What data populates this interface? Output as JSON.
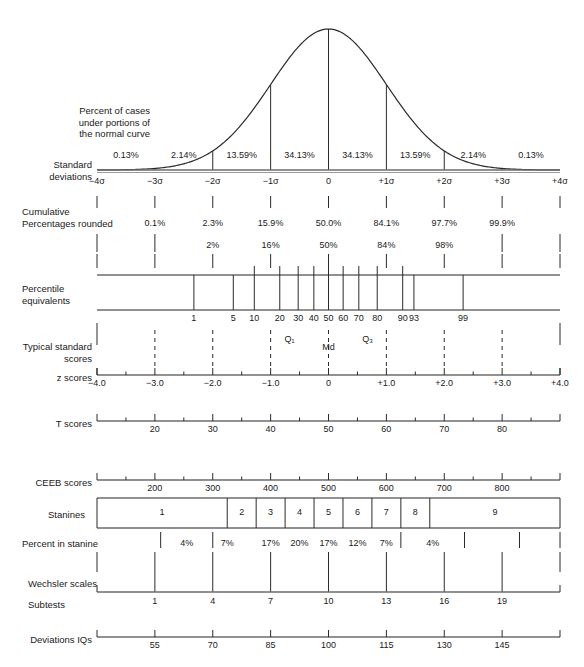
{
  "figure": {
    "faint_header": "",
    "axis": {
      "z_min": -4,
      "z_max": 4,
      "x_at_zmin": 97,
      "x_at_zmax": 560
    }
  },
  "rows": {
    "percent_cases": {
      "label_lines": [
        "Percent of cases",
        "under portions of",
        "the normal curve"
      ],
      "values": [
        "0.13%",
        "2.14%",
        "13.59%",
        "34.13%",
        "34.13%",
        "13.59%",
        "2.14%",
        "0.13%"
      ],
      "value_z_centers": [
        -3.5,
        -2.5,
        -1.5,
        -0.5,
        0.5,
        1.5,
        2.5,
        3.5
      ]
    },
    "standard_deviations": {
      "label_lines": [
        "Standard",
        "deviations"
      ],
      "tick_labels": [
        "−4σ",
        "−3σ",
        "−2σ",
        "−1σ",
        "0",
        "+1σ",
        "+2σ",
        "+3σ",
        "+4σ"
      ],
      "tick_z": [
        -4,
        -3,
        -2,
        -1,
        0,
        1,
        2,
        3,
        4
      ]
    },
    "cumulative_percentages": {
      "label_lines": [
        "Cumulative",
        "Percentages rounded"
      ],
      "values": [
        "0.1%",
        "2.3%",
        "15.9%",
        "50.0%",
        "84.1%",
        "97.7%",
        "99.9%"
      ],
      "value_z": [
        -3,
        -2,
        -1,
        0,
        1,
        2,
        3
      ],
      "rounded_values": [
        "2%",
        "16%",
        "50%",
        "84%",
        "98%"
      ],
      "rounded_z": [
        -2,
        -1,
        0,
        1,
        2
      ]
    },
    "percentile_equivalents": {
      "label_lines": [
        "Percentile",
        "equivalents"
      ],
      "values": [
        "1",
        "5",
        "10",
        "20",
        "30",
        "40",
        "50",
        "60",
        "70",
        "80",
        "90",
        "93",
        "99"
      ],
      "value_percentiles": [
        1,
        5,
        10,
        20,
        30,
        40,
        50,
        60,
        70,
        80,
        90,
        93,
        99
      ],
      "value_z": [
        -2.326,
        -1.645,
        -1.282,
        -0.842,
        -0.524,
        -0.253,
        0,
        0.253,
        0.524,
        0.842,
        1.282,
        1.476,
        2.326
      ]
    },
    "typical_standard_scores": {
      "label_lines": [
        "Typical standard",
        "scores"
      ],
      "quartile_labels": [
        "Q₁",
        "Md",
        "Q₃"
      ],
      "quartile_z": [
        -0.675,
        0,
        0.675
      ]
    },
    "z_scores": {
      "label": "z scores",
      "tick_labels": [
        "−4.0",
        "−3.0",
        "−2.0",
        "−1.0",
        "0",
        "+1.0",
        "+2.0",
        "+3.0",
        "+4.0"
      ],
      "tick_z": [
        -4,
        -3,
        -2,
        -1,
        0,
        1,
        2,
        3,
        4
      ]
    },
    "t_scores": {
      "label": "T scores",
      "tick_labels": [
        "20",
        "30",
        "40",
        "50",
        "60",
        "70",
        "80"
      ],
      "tick_z": [
        -3,
        -2,
        -1,
        0,
        1,
        2,
        3
      ]
    },
    "ceeb_scores": {
      "label": "CEEB scores",
      "tick_labels": [
        "200",
        "300",
        "400",
        "500",
        "600",
        "700",
        "800"
      ],
      "tick_z": [
        -3,
        -2,
        -1,
        0,
        1,
        2,
        3
      ]
    },
    "stanines": {
      "label": "Stanines",
      "values": [
        "1",
        "2",
        "3",
        "4",
        "5",
        "6",
        "7",
        "8",
        "9"
      ],
      "band_centers_z": [
        -2.5,
        -1.75,
        -1.25,
        -0.75,
        -0.25,
        0.25,
        0.75,
        1.25,
        1.75,
        2.5
      ],
      "band_edges_z": [
        -4,
        -1.75,
        -1.25,
        -0.75,
        -0.25,
        0.25,
        0.75,
        1.25,
        1.75,
        4
      ]
    },
    "percent_in_stanine": {
      "label": "Percent in stanine",
      "values": [
        "4%",
        "7%",
        "17%",
        "20%",
        "17%",
        "12%",
        "7%",
        "4%"
      ],
      "value_z": [
        -2.45,
        -1.75,
        -1.0,
        -0.5,
        0.0,
        0.5,
        1.0,
        1.8
      ]
    },
    "wechsler_scales": {
      "label": "Wechsler scales",
      "subtests_label": "Subtests",
      "tick_labels": [
        "1",
        "4",
        "7",
        "10",
        "13",
        "16",
        "19"
      ],
      "tick_z": [
        -3,
        -2,
        -1,
        0,
        1,
        2,
        3
      ]
    },
    "deviation_iqs": {
      "label": "Deviations IQs",
      "tick_labels": [
        "55",
        "70",
        "85",
        "100",
        "115",
        "130",
        "145"
      ],
      "tick_z": [
        -3,
        -2,
        -1,
        0,
        1,
        2,
        3
      ]
    }
  },
  "chart_data": {
    "type": "line",
    "xlabel": "Standard deviations (z)",
    "ylabel": "Relative frequency",
    "xlim": [
      -4,
      4
    ],
    "grid": false,
    "legend": "none",
    "series": [
      {
        "name": "Normal distribution density",
        "x": [
          -4,
          -3.5,
          -3,
          -2.5,
          -2,
          -1.5,
          -1,
          -0.5,
          0,
          0.5,
          1,
          1.5,
          2,
          2.5,
          3,
          3.5,
          4
        ],
        "y": [
          0.0001,
          0.0009,
          0.0044,
          0.0175,
          0.054,
          0.1295,
          0.242,
          0.3521,
          0.3989,
          0.3521,
          0.242,
          0.1295,
          0.054,
          0.0175,
          0.0044,
          0.0009,
          0.0001
        ]
      }
    ],
    "annotations": {
      "area_percentages": [
        {
          "interval": "-4σ to -3σ",
          "value": "0.13%"
        },
        {
          "interval": "-3σ to -2σ",
          "value": "2.14%"
        },
        {
          "interval": "-2σ to -1σ",
          "value": "13.59%"
        },
        {
          "interval": "-1σ to 0",
          "value": "34.13%"
        },
        {
          "interval": "0 to +1σ",
          "value": "34.13%"
        },
        {
          "interval": "+1σ to +2σ",
          "value": "13.59%"
        },
        {
          "interval": "+2σ to +3σ",
          "value": "2.14%"
        },
        {
          "interval": "+3σ to +4σ",
          "value": "0.13%"
        }
      ],
      "cumulative": [
        {
          "z": -3,
          "value": "0.1%"
        },
        {
          "z": -2,
          "value": "2.3%",
          "rounded": "2%"
        },
        {
          "z": -1,
          "value": "15.9%",
          "rounded": "16%"
        },
        {
          "z": 0,
          "value": "50.0%",
          "rounded": "50%"
        },
        {
          "z": 1,
          "value": "84.1%",
          "rounded": "84%"
        },
        {
          "z": 2,
          "value": "97.7%",
          "rounded": "98%"
        },
        {
          "z": 3,
          "value": "99.9%"
        }
      ],
      "scales": [
        {
          "name": "z scores",
          "at_z": [
            -4,
            -3,
            -2,
            -1,
            0,
            1,
            2,
            3,
            4
          ],
          "labels": [
            "-4.0",
            "-3.0",
            "-2.0",
            "-1.0",
            "0",
            "+1.0",
            "+2.0",
            "+3.0",
            "+4.0"
          ]
        },
        {
          "name": "T scores",
          "at_z": [
            -3,
            -2,
            -1,
            0,
            1,
            2,
            3
          ],
          "labels": [
            "20",
            "30",
            "40",
            "50",
            "60",
            "70",
            "80"
          ]
        },
        {
          "name": "CEEB scores",
          "at_z": [
            -3,
            -2,
            -1,
            0,
            1,
            2,
            3
          ],
          "labels": [
            "200",
            "300",
            "400",
            "500",
            "600",
            "700",
            "800"
          ]
        },
        {
          "name": "Wechsler subtests",
          "at_z": [
            -3,
            -2,
            -1,
            0,
            1,
            2,
            3
          ],
          "labels": [
            "1",
            "4",
            "7",
            "10",
            "13",
            "16",
            "19"
          ]
        },
        {
          "name": "Deviation IQs",
          "at_z": [
            -3,
            -2,
            -1,
            0,
            1,
            2,
            3
          ],
          "labels": [
            "55",
            "70",
            "85",
            "100",
            "115",
            "130",
            "145"
          ]
        },
        {
          "name": "Percentiles",
          "at_z": [
            -2.326,
            -1.645,
            -1.282,
            -0.842,
            -0.524,
            -0.253,
            0,
            0.253,
            0.524,
            0.842,
            1.282,
            1.476,
            2.326
          ],
          "labels": [
            "1",
            "5",
            "10",
            "20",
            "30",
            "40",
            "50",
            "60",
            "70",
            "80",
            "90",
            "93",
            "99"
          ]
        },
        {
          "name": "Stanines",
          "bands": [
            "1",
            "2",
            "3",
            "4",
            "5",
            "6",
            "7",
            "8",
            "9"
          ],
          "percent_in_stanine": [
            "4%",
            "7%",
            "12%",
            "17%",
            "20%",
            "17%",
            "12%",
            "7%",
            "4%"
          ]
        }
      ],
      "quartiles": [
        {
          "label": "Q1",
          "z": -0.675
        },
        {
          "label": "Md",
          "z": 0
        },
        {
          "label": "Q3",
          "z": 0.675
        }
      ]
    }
  }
}
